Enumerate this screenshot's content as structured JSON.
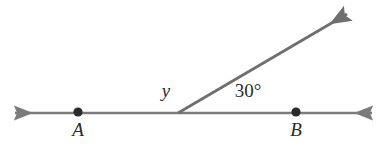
{
  "figure": {
    "background_color": "#ffffff",
    "width": 386,
    "height": 154
  },
  "style": {
    "line_color": "#7b7b7b",
    "ray_color": "#6f6f6f",
    "point_color": "#2a2a2a",
    "text_color": "#2b2b2b",
    "line_width": 2.6,
    "ray_width": 2.8
  },
  "geometry": {
    "vertex": {
      "x": 178,
      "y": 113
    },
    "line": {
      "name": "line-AB",
      "left_tip": {
        "x": 15,
        "y": 113
      },
      "right_tip": {
        "x": 372,
        "y": 113
      },
      "arrowheads": "both"
    },
    "ray": {
      "name": "ray-from-vertex",
      "start": {
        "x": 178,
        "y": 113
      },
      "tip": {
        "x": 347,
        "y": 14
      },
      "arrowheads": "end",
      "elevation_degrees": 30
    }
  },
  "points": [
    {
      "id": "A",
      "label": "A",
      "dot": {
        "x": 78,
        "y": 112,
        "r": 4.6
      },
      "label_pos": {
        "x": 78,
        "y": 136
      }
    },
    {
      "id": "B",
      "label": "B",
      "dot": {
        "x": 296,
        "y": 112,
        "r": 4.6
      },
      "label_pos": {
        "x": 296,
        "y": 136
      }
    }
  ],
  "angles": [
    {
      "id": "y",
      "label": "y",
      "label_pos": {
        "x": 166,
        "y": 97
      },
      "font_size": 19,
      "italic": true,
      "description": "unknown angle between ray OA and the ray"
    },
    {
      "id": "thirty",
      "label": "30°",
      "label_pos": {
        "x": 248,
        "y": 97
      },
      "font_size": 19,
      "italic": false,
      "description": "angle between ray and segment toward B"
    }
  ],
  "chart_data": {
    "type": "diagram",
    "annotations": [
      "A",
      "B",
      "y",
      "30°"
    ],
    "known_angle_degrees": 30,
    "unknown_angle_label": "y",
    "relationship": "y + 30 = 180"
  }
}
